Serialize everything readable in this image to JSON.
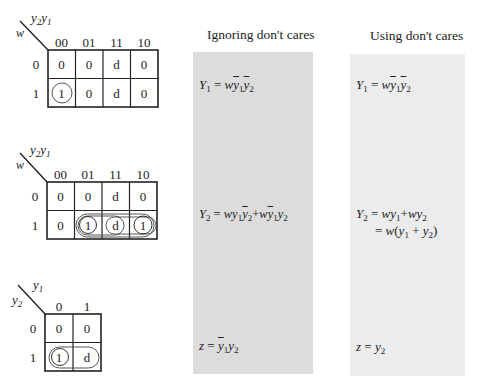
{
  "maps": [
    {
      "id": "Y1",
      "row_var": "w",
      "col_var": "y2y1",
      "col_labels": [
        "00",
        "01",
        "11",
        "10"
      ],
      "row_labels": [
        "0",
        "1"
      ],
      "cells": [
        [
          "0",
          "0",
          "d",
          "0"
        ],
        [
          "1",
          "0",
          "d",
          "0"
        ]
      ]
    },
    {
      "id": "Y2",
      "row_var": "w",
      "col_var": "y2y1",
      "col_labels": [
        "00",
        "01",
        "11",
        "10"
      ],
      "row_labels": [
        "0",
        "1"
      ],
      "cells": [
        [
          "0",
          "0",
          "d",
          "0"
        ],
        [
          "0",
          "1",
          "d",
          "1"
        ]
      ]
    },
    {
      "id": "z",
      "row_var": "y2",
      "col_var": "y1",
      "col_labels": [
        "0",
        "1"
      ],
      "row_labels": [
        "0",
        "1"
      ],
      "cells": [
        [
          "0",
          "0"
        ],
        [
          "1",
          "d"
        ]
      ]
    }
  ],
  "columns": {
    "ignoring": {
      "header": "Ignoring don't cares",
      "bg": "#dcdcdc",
      "Y1": "Y1 = w y1' y2'",
      "Y2": "Y2 = w y1 y2' + w y1' y2",
      "z": "z = y1' y2"
    },
    "using": {
      "header": "Using don't cares",
      "bg": "#ececec",
      "Y1": "Y1 = w y1' y2",
      "Y2_line1": "Y2 = w y1 + w y2",
      "Y2_line2": "= w(y1 + y2)",
      "z": "z = y2"
    }
  },
  "text": {
    "w": "w",
    "y": "y",
    "Y": "Y",
    "z": "z",
    "eq": "=",
    "plus": "+",
    "one": "1",
    "two": "2",
    "lp": "(",
    "rp": ")"
  }
}
